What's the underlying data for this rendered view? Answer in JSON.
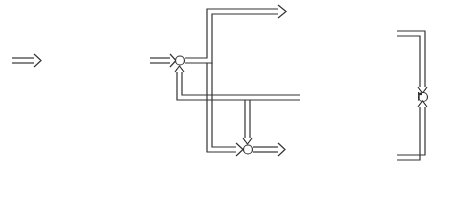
{
  "blocks": {
    "control_law": {
      "title_line1": "Model State",
      "title_line2": "Control Law",
      "equation": {
        "lhs": "u",
        "lhs_sub": "m",
        "eq": " = ",
        "t1": "R",
        "t1_sub": "m",
        "t1b": "y",
        "t1b_sub": "r",
        "minus": " − ",
        "t2": "K",
        "t2_sub": "m",
        "t2b": "x",
        "t2b_sub": "m"
      }
    },
    "real_plant": {
      "title": "Real Plant",
      "eq1": {
        "lhs": "ẋ",
        "mid": " = ",
        "f": "F",
        "args": "(x, u)"
      },
      "eq2": {
        "lhs": "y",
        "mid": " = ",
        "f": "H",
        "args": "(x)"
      }
    },
    "correction": {
      "title_line1": "Correction Loop",
      "title_line2": "Controller"
    },
    "plant_model": {
      "title": "Plant Model",
      "eq1": {
        "lhs": "ẋ",
        "lhs_sub": "m",
        "mid": " = ",
        "a": "A",
        "a_sub": "m",
        "x": "x",
        "x_sub": "m",
        "plus": " + ",
        "b": "B",
        "b_sub": "m",
        "u": "u",
        "u_sub": "m"
      },
      "eq2": {
        "lhs": "y",
        "lhs_sub": "m",
        "mid": " = ",
        "f": "H",
        "arg_open": "(",
        "arg": "x",
        "arg_sub": "m",
        "arg_close": ")"
      }
    },
    "observer": {
      "label": "Observer"
    }
  },
  "signals": {
    "yr": {
      "base": "y",
      "sub": "r"
    },
    "um_top": {
      "base": "u",
      "sub": "m"
    },
    "u": {
      "base": "u"
    },
    "uc_top": {
      "base": "û",
      "sub": "c"
    },
    "uc_low": {
      "base": "û",
      "sub": "c"
    },
    "um_low": {
      "base": "u",
      "sub": "m"
    },
    "y": {
      "base": "y"
    },
    "e": {
      "base": "e"
    },
    "ym": {
      "base": "y",
      "sub": "m"
    },
    "xm": {
      "base": "x",
      "sub": "m"
    }
  },
  "signs": {
    "sum1_left": "+",
    "sum1_bottom": "+",
    "sum2_left": "+",
    "sum2_top": "−",
    "sum3_top": "+",
    "sum3_bottom": "−"
  }
}
